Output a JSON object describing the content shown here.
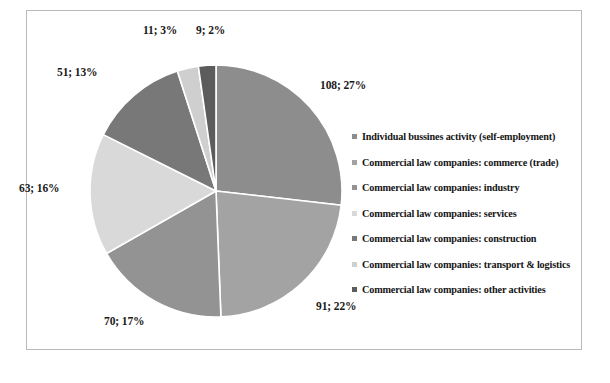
{
  "chart_data": {
    "type": "pie",
    "title": "",
    "subtitle": "",
    "xlabel": "",
    "ylabel": "",
    "legend_position": "right",
    "grid": false,
    "total": 403,
    "start_angle_deg": 0,
    "direction": "clockwise",
    "categories": [
      "Individual bussines activity (self-employment)",
      "Commercial law companies: commerce (trade)",
      "Commercial law companies: industry",
      "Commercial law companies: services",
      "Commercial law companies: construction",
      "Commercial law companies: transport & logistics",
      "Commercial law companies: other activities"
    ],
    "values": [
      108,
      91,
      70,
      63,
      51,
      11,
      9
    ],
    "percents": [
      27,
      22,
      17,
      16,
      13,
      3,
      2
    ],
    "colors": [
      "#8d8d8d",
      "#a3a3a3",
      "#939393",
      "#d9d9d9",
      "#787878",
      "#cfcfcf",
      "#5c5c5c"
    ],
    "data_labels": [
      {
        "text": "108; 27%",
        "left": 320,
        "top": 79
      },
      {
        "text": "91; 22%",
        "left": 316,
        "top": 300
      },
      {
        "text": "70; 17%",
        "left": 104,
        "top": 315
      },
      {
        "text": "63; 16%",
        "left": 19,
        "top": 182
      },
      {
        "text": "51; 13%",
        "left": 57,
        "top": 66
      },
      {
        "text": "11; 3%",
        "left": 143,
        "top": 24
      },
      {
        "text": "9; 2%",
        "left": 196,
        "top": 24
      }
    ],
    "geometry": {
      "cx": 216,
      "cy": 191,
      "r": 126,
      "slice_border_color": "#ffffff"
    },
    "frame_color": "#b9b9b9",
    "background": "#ffffff"
  }
}
